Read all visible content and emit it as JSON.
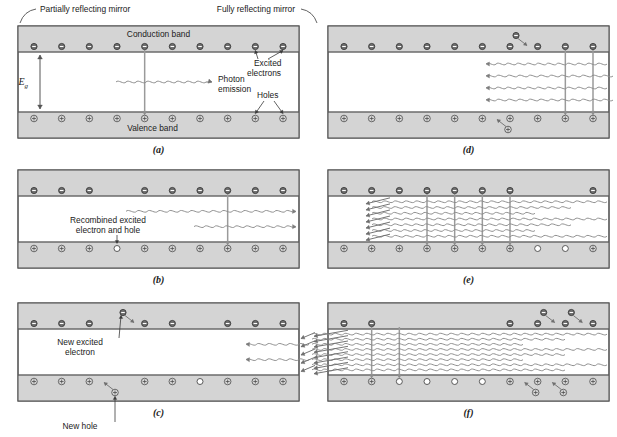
{
  "figure": {
    "colors": {
      "band_fill": "#d4d4d4",
      "band_stroke": "#6b6b6b",
      "outer_stroke": "#555555",
      "carrier_stroke": "#4a4a4a",
      "electron_fill": "#707070",
      "hole_fill": "#d9d9d9",
      "empty_fill": "#ffffff",
      "wave_stroke": "#8a8a8a",
      "arrow_stroke": "#6e6e6e",
      "leader_stroke": "#3a3a3a",
      "text": "#1a1a1a"
    },
    "panels": [
      {
        "id": "a",
        "letter": "(a)",
        "labels": {
          "partial_mirror": "Partially reflecting mirror",
          "full_mirror": "Fully reflecting mirror",
          "conduction_band": "Conduction band",
          "valence_band": "Valence band",
          "photon_emission_line1": "Photon",
          "photon_emission_line2": "emission",
          "excited_line1": "Excited",
          "excited_line2": "electrons",
          "holes": "Holes",
          "band_gap": "E",
          "band_gap_sub": "g"
        },
        "conduction_carriers": [
          "e",
          "e",
          "e",
          "e",
          "e",
          "e",
          "e",
          "e",
          "e",
          "e"
        ],
        "valence_carriers": [
          "h",
          "h",
          "h",
          "h",
          "h",
          "h",
          "h",
          "h",
          "h",
          "h"
        ],
        "recombination_columns": [
          4
        ],
        "wave_count": 1,
        "incoming_arrows": 0
      },
      {
        "id": "b",
        "letter": "(b)",
        "labels": {
          "recombined_line1": "Recombined excited",
          "recombined_line2": "electron and hole"
        },
        "conduction_carriers": [
          "e",
          "e",
          "e",
          "x",
          "e",
          "e",
          "e",
          "e",
          "e",
          "e"
        ],
        "valence_carriers": [
          "h",
          "h",
          "h",
          "o",
          "h",
          "h",
          "h",
          "h",
          "h",
          "h"
        ],
        "recombination_columns": [
          7
        ],
        "wave_count": 2,
        "incoming_arrows": 0
      },
      {
        "id": "c",
        "letter": "(c)",
        "labels": {
          "new_excited_line1": "New excited",
          "new_excited_line2": "electron",
          "new_hole": "New hole"
        },
        "conduction_carriers": [
          "e",
          "e",
          "e",
          "e*",
          "e",
          "e",
          "x",
          "e",
          "e",
          "e"
        ],
        "valence_carriers": [
          "h",
          "h",
          "h",
          "h*",
          "h",
          "h",
          "o",
          "h",
          "h",
          "h"
        ],
        "recombination_columns": [],
        "wave_count": 2,
        "incoming_arrows": 5
      },
      {
        "id": "d",
        "letter": "(d)",
        "conduction_carriers": [
          "e",
          "e",
          "e",
          "e",
          "e",
          "e",
          "e*",
          "e",
          "e",
          "e"
        ],
        "valence_carriers": [
          "h",
          "h",
          "h",
          "h",
          "h",
          "h",
          "h*",
          "h",
          "h",
          "h"
        ],
        "recombination_columns": [
          8,
          9
        ],
        "wave_count": 4,
        "incoming_arrows": 0
      },
      {
        "id": "e",
        "letter": "(e)",
        "conduction_carriers": [
          "e",
          "e",
          "e",
          "e",
          "e",
          "e",
          "e",
          "x",
          "x",
          "e"
        ],
        "valence_carriers": [
          "h",
          "h",
          "h",
          "h",
          "h",
          "h",
          "h",
          "o",
          "o",
          "h"
        ],
        "recombination_columns": [
          3,
          4,
          5,
          6
        ],
        "wave_count": 7,
        "incoming_arrows": 7
      },
      {
        "id": "f",
        "letter": "(f)",
        "conduction_carriers": [
          "e",
          "e",
          "x",
          "x",
          "x",
          "x",
          "e",
          "e*",
          "e*",
          "e"
        ],
        "valence_carriers": [
          "h",
          "h",
          "o",
          "o",
          "o",
          "o",
          "h",
          "h*",
          "h*",
          "h"
        ],
        "recombination_columns": [
          1,
          2
        ],
        "wave_count": 8,
        "incoming_arrows": 8
      }
    ]
  }
}
